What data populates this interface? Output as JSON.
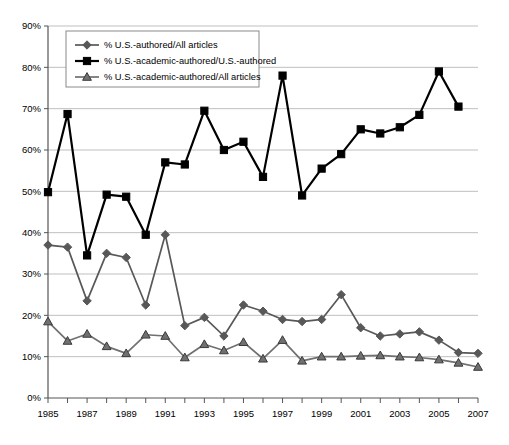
{
  "chart_data": {
    "type": "line",
    "title": "",
    "xlabel": "",
    "ylabel": "",
    "xlim": [
      1985,
      2007
    ],
    "ylim": [
      0,
      90
    ],
    "ytick_labels": [
      "0%",
      "10%",
      "20%",
      "30%",
      "40%",
      "50%",
      "60%",
      "70%",
      "80%",
      "90%"
    ],
    "ytick_values": [
      0,
      10,
      20,
      30,
      40,
      50,
      60,
      70,
      80,
      90
    ],
    "x": [
      1985,
      1986,
      1987,
      1988,
      1989,
      1990,
      1991,
      1992,
      1993,
      1994,
      1995,
      1996,
      1997,
      1998,
      1999,
      2000,
      2001,
      2002,
      2003,
      2004,
      2005,
      2006,
      2007
    ],
    "xtick_labels": [
      "1985",
      "",
      "1987",
      "",
      "1989",
      "",
      "1991",
      "",
      "1993",
      "",
      "1995",
      "",
      "1997",
      "",
      "1999",
      "",
      "2001",
      "",
      "2003",
      "",
      "2005",
      "",
      "2007"
    ],
    "grid": "horizontal",
    "legend_position": "top-left",
    "series": [
      {
        "name": "% U.S.-authored/All articles",
        "marker": "diamond",
        "color": "#585858",
        "values": [
          37.0,
          36.5,
          23.5,
          35.0,
          34.0,
          22.5,
          39.5,
          17.5,
          19.5,
          15.0,
          22.5,
          21.0,
          19.0,
          18.5,
          19.0,
          25.0,
          17.0,
          15.0,
          15.5,
          16.0,
          14.0,
          11.0,
          10.8
        ]
      },
      {
        "name": "% U.S.-academic-authored/U.S.-authored",
        "marker": "square",
        "color": "#000000",
        "values": [
          49.8,
          68.7,
          34.5,
          49.2,
          48.7,
          39.5,
          57.0,
          56.5,
          69.5,
          60.0,
          62.0,
          53.5,
          78.0,
          49.0,
          55.5,
          59.0,
          65.0,
          64.0,
          65.5,
          68.5,
          79.0,
          70.5,
          null
        ]
      },
      {
        "name": "% U.S.-academic-authored/All articles",
        "marker": "triangle",
        "color": "#707070",
        "values": [
          18.5,
          13.8,
          15.5,
          12.5,
          10.8,
          15.3,
          15.0,
          9.8,
          13.0,
          11.5,
          13.5,
          9.5,
          14.0,
          9.0,
          10.0,
          10.0,
          10.2,
          10.3,
          10.0,
          9.8,
          9.3,
          8.5,
          7.5
        ]
      }
    ],
    "series_notes": {
      "square_year_alignment": "square series plotted 1985-2006 then 2007 at 70.5",
      "square_values_by_year": {
        "1985": 49.8,
        "1986": 68.7,
        "1987": 34.5,
        "1988": 49.2,
        "1989": 48.7,
        "1990": 39.5,
        "1991": 57.0,
        "1992": 56.5,
        "1993": 69.5,
        "1994": 60.0,
        "1995": 62.0,
        "1996": 53.5,
        "1997": 78.0,
        "1998": 49.0,
        "1999": 55.5,
        "2000": 59.0,
        "2001": 65.0,
        "2002": 64.0,
        "2003": 65.5,
        "2004": 68.5,
        "2005": 79.0,
        "2006": 70.5
      }
    }
  },
  "legend": {
    "items": [
      {
        "label": "% U.S.-authored/All articles",
        "marker": "diamond",
        "color": "#585858"
      },
      {
        "label": "% U.S.-academic-authored/U.S.-authored",
        "marker": "square",
        "color": "#000000"
      },
      {
        "label": "% U.S.-academic-authored/All articles",
        "marker": "triangle",
        "color": "#707070"
      }
    ]
  },
  "colors": {
    "axis": "#555555",
    "grid": "#b8b8b8",
    "plot_background": "#ffffff",
    "legend_border": "#8a8a8a"
  }
}
